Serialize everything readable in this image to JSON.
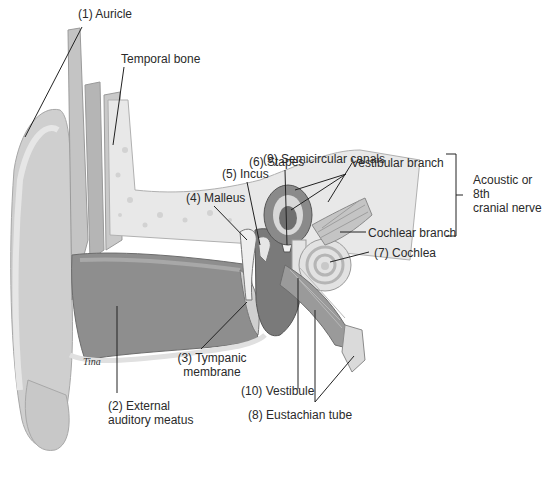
{
  "diagram": {
    "labels": {
      "auricle": "(1) Auricle",
      "temporal_bone": "Temporal bone",
      "semicircular_canals": "(9) Semicircular canals",
      "stapes": "(6) Stapes",
      "incus": "(5) Incus",
      "malleus": "(4) Malleus",
      "vestibular_branch": "Vestibular branch",
      "cochlear_branch": "Cochlear branch",
      "cochlea": "(7) Cochlea",
      "acoustic_nerve_line1": "Acoustic or",
      "acoustic_nerve_line2": "8th",
      "acoustic_nerve_line3": "cranial nerve",
      "tympanic_line1": "(3) Tympanic",
      "tympanic_line2": "membrane",
      "external_line1": "(2) External",
      "external_line2": "auditory meatus",
      "vestibule": "(10) Vestibule",
      "eustachian": "(8) Eustachian tube",
      "signature": "Tina"
    },
    "colors": {
      "skin_light": "#d6d6d6",
      "skin_mid": "#b8b8b8",
      "canal_dark": "#8c8c8c",
      "bone": "#e4e4e4",
      "leader": "#222222"
    }
  }
}
